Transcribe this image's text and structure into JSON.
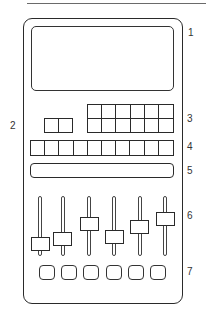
{
  "diagram": {
    "type": "device-layout-schematic",
    "callouts": [
      {
        "number": "1",
        "target": "display-screen"
      },
      {
        "number": "2",
        "target": "two-key-block"
      },
      {
        "number": "3",
        "target": "key-grid-6x2"
      },
      {
        "number": "4",
        "target": "key-row-10"
      },
      {
        "number": "5",
        "target": "strip-bar"
      },
      {
        "number": "6",
        "target": "faders"
      },
      {
        "number": "7",
        "target": "button-row"
      }
    ],
    "components": {
      "screen": {
        "count": 1
      },
      "two_key_block": {
        "columns": 2,
        "rows": 1
      },
      "key_grid": {
        "columns": 6,
        "rows": 2
      },
      "key_row": {
        "columns": 10,
        "rows": 1
      },
      "strip_bar": {
        "count": 1
      },
      "faders": {
        "count": 6,
        "handle_top_y": [
          237,
          232,
          217,
          230,
          220,
          212
        ]
      },
      "buttons": {
        "count": 6
      }
    },
    "colors": {
      "line": "#2a2a2a",
      "background": "#ffffff"
    }
  },
  "labels": {
    "l1": "1",
    "l2": "2",
    "l3": "3",
    "l4": "4",
    "l5": "5",
    "l6": "6",
    "l7": "7"
  }
}
